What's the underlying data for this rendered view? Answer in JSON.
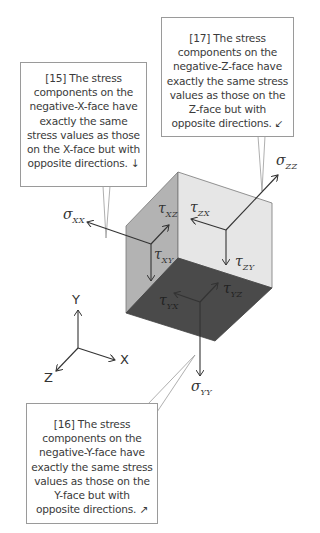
{
  "callouts": {
    "x_face": {
      "number": "[15]",
      "text": "The stress components on the negative-X-face have exactly the same stress values as those on the X-face but with opposite directions.",
      "arrow_glyph": "↓"
    },
    "z_face": {
      "number": "[17]",
      "text": "The stress components on the negative-Z-face have exactly the same stress values as those on the Z-face but with opposite directions.",
      "arrow_glyph": "↙"
    },
    "y_face": {
      "number": "[16]",
      "text": "The stress components on the negative-Y-face have exactly the same stress values as those on the Y-face but with opposite directions.",
      "arrow_glyph": "↗"
    }
  },
  "stress_labels": {
    "sigma_xx": {
      "symbol": "σ",
      "sub": "XX"
    },
    "sigma_zz": {
      "symbol": "σ",
      "sub": "ZZ"
    },
    "sigma_yy": {
      "symbol": "σ",
      "sub": "YY"
    },
    "tau_xz": {
      "symbol": "τ",
      "sub": "XZ"
    },
    "tau_xy": {
      "symbol": "τ",
      "sub": "XY"
    },
    "tau_zx": {
      "symbol": "τ",
      "sub": "ZX"
    },
    "tau_zy": {
      "symbol": "τ",
      "sub": "ZY"
    },
    "tau_yx": {
      "symbol": "τ",
      "sub": "YX"
    },
    "tau_yz": {
      "symbol": "τ",
      "sub": "YZ"
    }
  },
  "axes": {
    "x": "X",
    "y": "Y",
    "z": "Z"
  },
  "colors": {
    "x_face": "#b3b3b3",
    "z_face": "#e6e6e6",
    "y_face": "#4a4a4a",
    "line": "#333333",
    "bubble_border": "#9a9a9a"
  }
}
